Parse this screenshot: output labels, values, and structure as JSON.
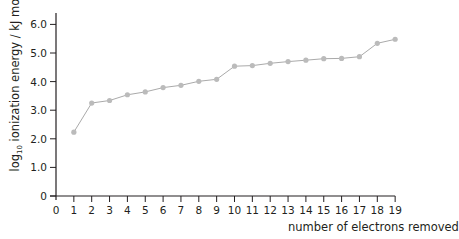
{
  "chart_data": {
    "type": "line",
    "title": "",
    "xlabel": "number of electrons removed",
    "ylabel": {
      "prefix": "log",
      "subscript": "10",
      "main": " ionization energy / kJ mol",
      "superscript": "-1"
    },
    "x": [
      1,
      2,
      3,
      4,
      5,
      6,
      7,
      8,
      9,
      10,
      11,
      12,
      13,
      14,
      15,
      16,
      17,
      18,
      19
    ],
    "series": [
      {
        "name": "log10 ionization energy",
        "values": [
          2.23,
          3.25,
          3.34,
          3.54,
          3.64,
          3.79,
          3.87,
          4.01,
          4.08,
          4.54,
          4.56,
          4.64,
          4.7,
          4.75,
          4.8,
          4.81,
          4.87,
          5.34,
          5.48
        ]
      }
    ],
    "xlim": [
      0,
      19
    ],
    "ylim": [
      0,
      6.0
    ],
    "x_ticks": [
      "0",
      "1",
      "2",
      "3",
      "4",
      "5",
      "6",
      "7",
      "8",
      "9",
      "10",
      "11",
      "12",
      "13",
      "14",
      "15",
      "16",
      "17",
      "18",
      "19"
    ],
    "y_ticks": [
      "0",
      "1.0",
      "2.0",
      "3.0",
      "4.0",
      "5.0",
      "6.0"
    ],
    "grid": false,
    "legend": null,
    "colors": {
      "line": "#aaaaaa",
      "marker": "#bbbbbb",
      "axis": "#231f20"
    }
  }
}
